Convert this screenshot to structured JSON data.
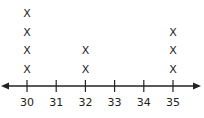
{
  "chart_data": {
    "type": "scatter",
    "subtype": "line-plot (dot plot with X marks)",
    "title": "",
    "xlabel": "",
    "ylabel": "",
    "categories": [
      "30",
      "31",
      "32",
      "33",
      "34",
      "35"
    ],
    "x": [
      30,
      31,
      32,
      33,
      34,
      35
    ],
    "counts": [
      4,
      0,
      2,
      0,
      0,
      3
    ],
    "marker": "X",
    "xlim": [
      30,
      35
    ],
    "axis_arrows": "both ends",
    "grid": false,
    "legend": "none"
  }
}
